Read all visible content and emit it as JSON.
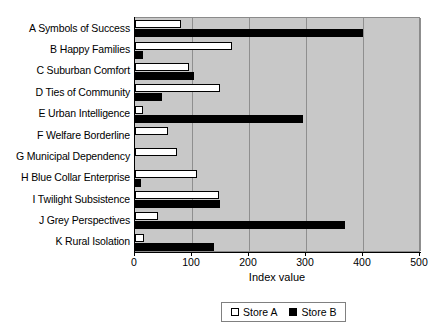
{
  "chart_data": {
    "type": "bar",
    "orientation": "horizontal",
    "title": "",
    "xlabel": "Index value",
    "ylabel": "",
    "xlim": [
      0,
      500
    ],
    "xticks": [
      0,
      100,
      200,
      300,
      400,
      500
    ],
    "grid": true,
    "grid_axis": "x",
    "legend_position": "bottom",
    "plot_background": "#c8c8c8",
    "categories": [
      "A Symbols of Success",
      "B Happy Families",
      "C Suburban Comfort",
      "D Ties of Community",
      "E Urban Intelligence",
      "F Welfare Borderline",
      "G Municipal Dependency",
      "H Blue Collar Enterprise",
      "I Twilight Subsistence",
      "J Grey Perspectives",
      "K Rural Isolation"
    ],
    "series": [
      {
        "name": "Store A",
        "color": "#ffffff",
        "edge_color": "#000000",
        "values": [
          80,
          171,
          94,
          149,
          14,
          58,
          73,
          108,
          147,
          41,
          16
        ]
      },
      {
        "name": "Store B",
        "color": "#000000",
        "edge_color": "#000000",
        "values": [
          400,
          14,
          103,
          47,
          295,
          0,
          0,
          10,
          149,
          369,
          139
        ]
      }
    ]
  },
  "legend": {
    "entries": [
      {
        "label": "Store A",
        "swatch": "white-square-swatch"
      },
      {
        "label": "Store B",
        "swatch": "black-square-swatch"
      }
    ]
  }
}
